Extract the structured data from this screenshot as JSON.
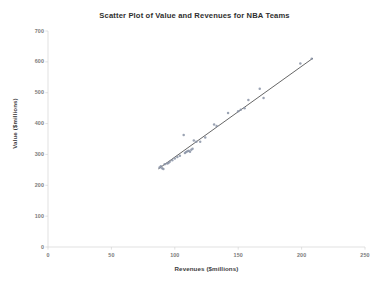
{
  "chart_data": {
    "type": "scatter",
    "title": "Scatter Plot of Value and Revenues for NBA Teams",
    "xlabel": "Revenues ($millions)",
    "ylabel": "Value ($millions)",
    "xlim": [
      0,
      250
    ],
    "ylim": [
      0,
      700
    ],
    "xticks": [
      "0",
      "50",
      "100",
      "150",
      "200",
      "250"
    ],
    "yticks": [
      "0",
      "100",
      "200",
      "300",
      "400",
      "500",
      "600",
      "700"
    ],
    "grid": false,
    "legend": "none",
    "marker_color": "#8a93a6",
    "trendline_color": "#4a4a4a",
    "axis_color": "#d4d4d4",
    "series": [
      {
        "name": "NBA Teams",
        "points": [
          [
            88,
            258
          ],
          [
            89,
            262
          ],
          [
            90,
            255
          ],
          [
            91,
            253
          ],
          [
            92,
            268
          ],
          [
            94,
            271
          ],
          [
            95,
            272
          ],
          [
            96,
            276
          ],
          [
            98,
            281
          ],
          [
            100,
            287
          ],
          [
            102,
            292
          ],
          [
            104,
            296
          ],
          [
            107,
            363
          ],
          [
            108,
            305
          ],
          [
            109,
            308
          ],
          [
            110,
            310
          ],
          [
            111,
            312
          ],
          [
            112,
            309
          ],
          [
            113,
            315
          ],
          [
            114,
            318
          ],
          [
            115,
            345
          ],
          [
            117,
            341
          ],
          [
            120,
            341
          ],
          [
            124,
            355
          ],
          [
            131,
            397
          ],
          [
            133,
            392
          ],
          [
            142,
            434
          ],
          [
            150,
            440
          ],
          [
            152,
            445
          ],
          [
            155,
            450
          ],
          [
            158,
            476
          ],
          [
            167,
            513
          ],
          [
            170,
            483
          ],
          [
            199,
            595
          ],
          [
            208,
            610
          ]
        ]
      }
    ],
    "trendline": {
      "x_start": 87,
      "y_start": 253,
      "x_end": 209,
      "y_end": 612
    }
  }
}
